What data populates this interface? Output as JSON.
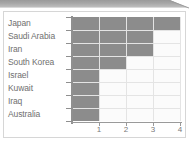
{
  "chart_data": {
    "type": "bar",
    "orientation": "horizontal",
    "title": "",
    "xlabel": "",
    "ylabel": "",
    "xlim": [
      0,
      4
    ],
    "xticks": [
      "1",
      "2",
      "3",
      "4"
    ],
    "grid": true,
    "legend": "none",
    "bar_color": "#8c8c8c",
    "plot_background": "#fbfbfb",
    "gridline_color": "#e4e4e4",
    "axis_color": "#8f8f8f",
    "label_color": "#6f6f6f",
    "categories": [
      "Japan",
      "Saudi Arabia",
      "Iran",
      "South Korea",
      "Israel",
      "Kuwait",
      "Iraq",
      "Australia"
    ],
    "values": [
      4,
      3,
      3,
      2,
      1,
      1,
      1,
      1
    ]
  }
}
